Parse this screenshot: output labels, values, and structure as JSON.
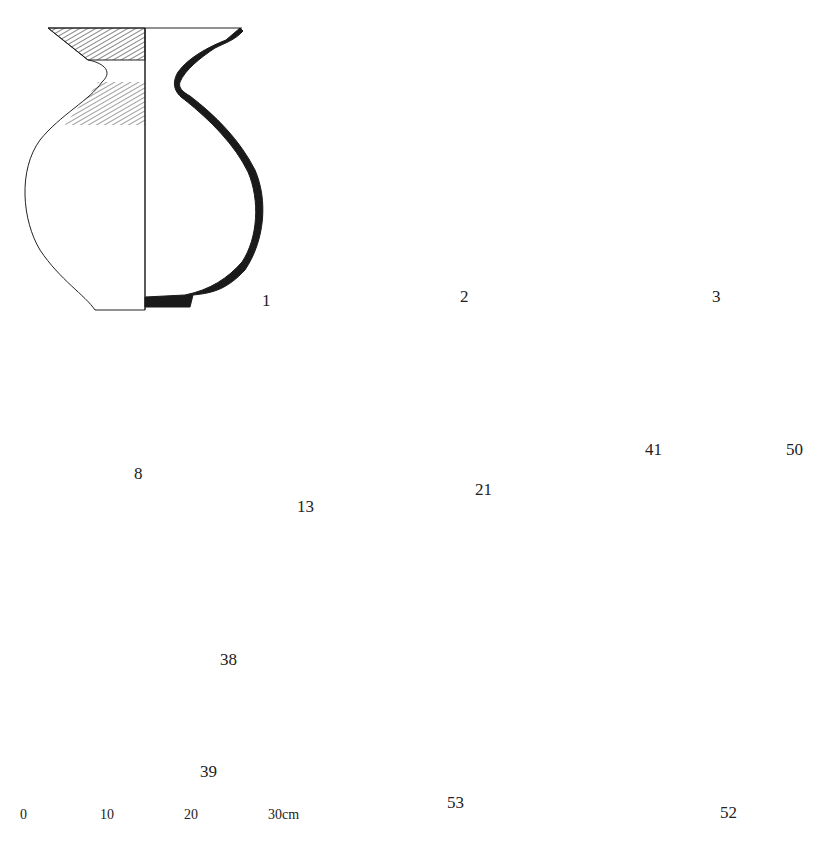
{
  "plate": {
    "title": "Pottery vessel profile drawings",
    "colors": {
      "ink": "#1a1a1a",
      "background": "#ffffff"
    },
    "vessels": [
      {
        "id": "1",
        "label": "1",
        "type": "jar"
      },
      {
        "id": "2",
        "label": "2",
        "type": "jar"
      },
      {
        "id": "3",
        "label": "3",
        "type": "jar"
      },
      {
        "id": "8",
        "label": "8",
        "type": "small jar"
      },
      {
        "id": "13",
        "label": "13",
        "type": "long-necked jar"
      },
      {
        "id": "21",
        "label": "21",
        "type": "jar"
      },
      {
        "id": "41",
        "label": "41",
        "type": "stand"
      },
      {
        "id": "50",
        "label": "50",
        "type": "stand"
      },
      {
        "id": "38",
        "label": "38",
        "type": "pedestal bowl"
      },
      {
        "id": "39",
        "label": "39",
        "type": "pedestal bowl"
      },
      {
        "id": "53",
        "label": "53",
        "type": "pedestal jar"
      },
      {
        "id": "52",
        "label": "52",
        "type": "pedestal jar"
      }
    ]
  },
  "scale_bar": {
    "ticks": [
      "0",
      "10",
      "20",
      "30cm"
    ],
    "unit": "cm",
    "length_cm": 30
  }
}
